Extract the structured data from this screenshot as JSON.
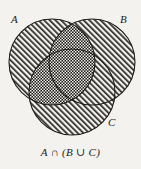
{
  "figure": {
    "type": "venn-diagram",
    "background_color": "#f4f2ee",
    "ink_color": "#1c1a18",
    "caption": "A ∩ (B ∪ C)"
  },
  "labels": {
    "a": "A",
    "b": "B",
    "c": "C"
  },
  "sets": [
    {
      "id": "A",
      "label": "A",
      "position": "top-left",
      "center": [
        52,
        62
      ],
      "radius": 43,
      "fill": "diagonal-hatch",
      "stroke": "#1c1a18"
    },
    {
      "id": "B",
      "label": "B",
      "position": "top-right",
      "center": [
        92,
        62
      ],
      "radius": 43,
      "fill": "diagonal-hatch",
      "stroke": "#1c1a18"
    },
    {
      "id": "C",
      "label": "C",
      "position": "bottom-center",
      "center": [
        72,
        92
      ],
      "radius": 43,
      "fill": "diagonal-hatch",
      "stroke": "#1c1a18"
    }
  ],
  "highlight": {
    "expression": "A ∩ (B ∪ C)",
    "fill": "cross-hatch-dense",
    "regions": [
      "A∩B only",
      "A∩C only",
      "A∩B∩C"
    ]
  },
  "icons": {
    "intersection": "intersection-icon",
    "union": "union-icon"
  }
}
